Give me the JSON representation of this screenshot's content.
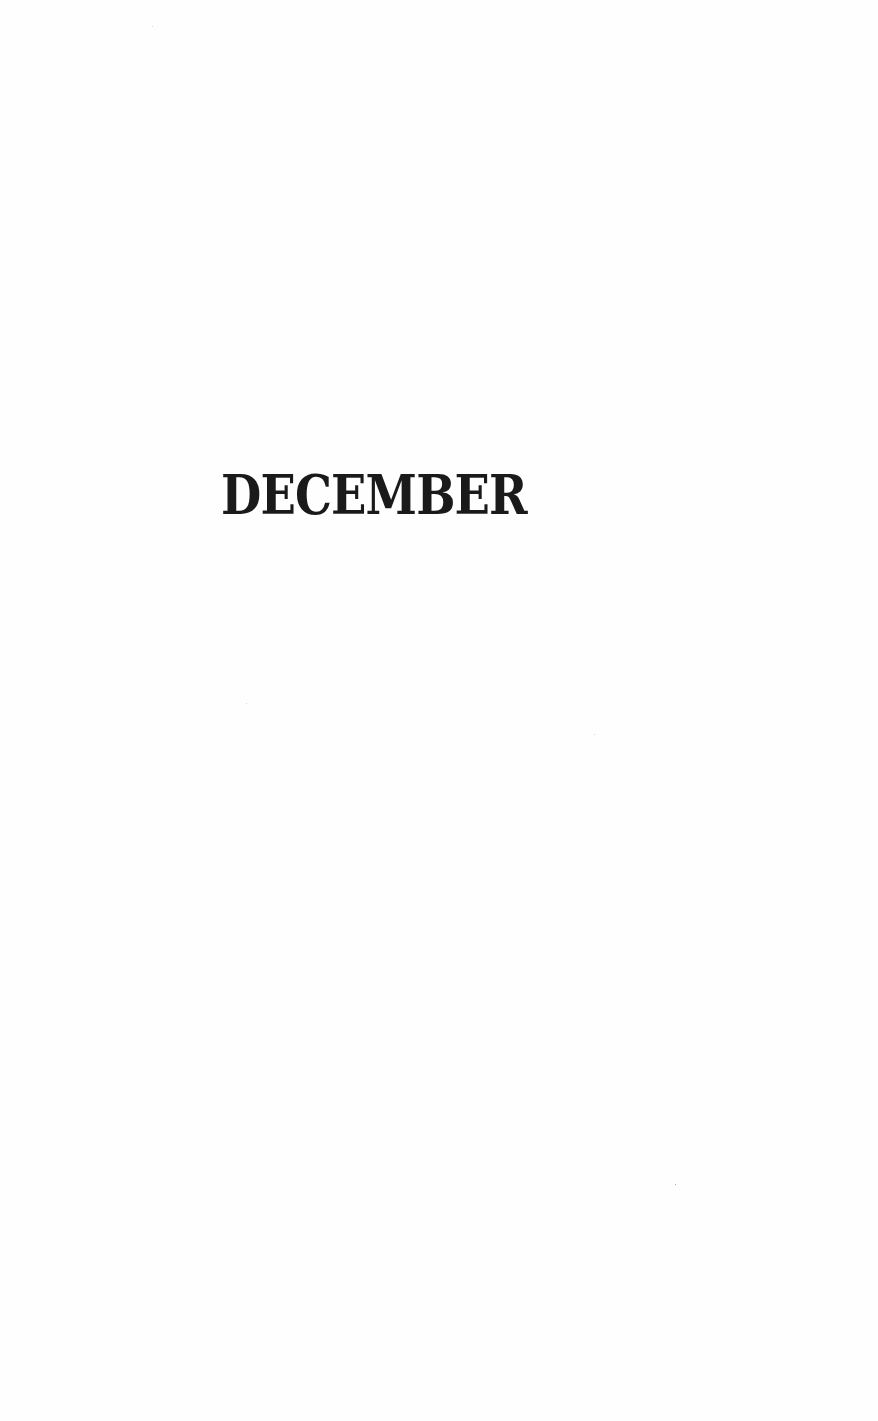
{
  "page": {
    "chapter_title": "DECEMBER"
  }
}
